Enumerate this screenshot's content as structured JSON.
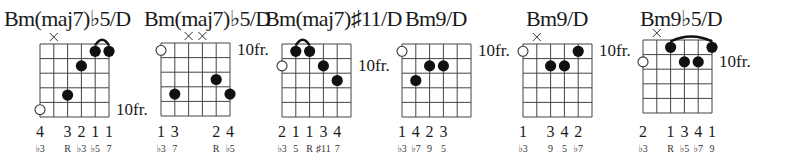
{
  "diagram": {
    "strings": 6,
    "frets_shown": 5,
    "chords": [
      {
        "name": "Bm(maj7)♭5/D",
        "grid_x": 40,
        "grid_y": 44,
        "title_x": 4,
        "fret_position": "10fr.",
        "fret_label_row": 5,
        "muted": [
          2
        ],
        "open": [
          {
            "string": 1,
            "row": 5
          }
        ],
        "dots": [
          {
            "string": 5,
            "fret": 1
          },
          {
            "string": 6,
            "fret": 1
          },
          {
            "string": 4,
            "fret": 2
          },
          {
            "string": 3,
            "fret": 4
          }
        ],
        "barre": {
          "from": 5,
          "to": 6,
          "fret": 1
        },
        "fingers": [
          "4",
          "",
          "3",
          "2",
          "1",
          "1"
        ],
        "degrees": [
          "♭3",
          "",
          "R",
          "♭3",
          "♭5",
          "7"
        ]
      },
      {
        "name": "Bm(maj7)♭5/D",
        "grid_x": 161,
        "grid_y": 43,
        "title_x": 144,
        "fret_position": "10fr.",
        "fret_label_row": 1,
        "muted": [
          3,
          4
        ],
        "open": [
          {
            "string": 1,
            "row": 1
          }
        ],
        "dots": [
          {
            "string": 5,
            "fret": 3
          },
          {
            "string": 2,
            "fret": 4
          },
          {
            "string": 6,
            "fret": 4
          }
        ],
        "barre": null,
        "fingers": [
          "1",
          "3",
          "",
          "",
          "2",
          "4"
        ],
        "degrees": [
          "♭3",
          "7",
          "",
          "",
          "R",
          "♭5"
        ]
      },
      {
        "name": "Bm(maj7)♯11/D",
        "grid_x": 282,
        "grid_y": 44,
        "title_x": 265,
        "fret_position": "10fr.",
        "fret_label_row": 2,
        "muted": [],
        "open": [
          {
            "string": 1,
            "row": 2
          }
        ],
        "dots": [
          {
            "string": 2,
            "fret": 1
          },
          {
            "string": 3,
            "fret": 1
          },
          {
            "string": 4,
            "fret": 2
          },
          {
            "string": 5,
            "fret": 3
          }
        ],
        "barre": {
          "from": 2,
          "to": 3,
          "fret": 1
        },
        "fingers": [
          "2",
          "1",
          "1",
          "3",
          "4",
          ""
        ],
        "degrees": [
          "♭3",
          "5",
          "R",
          "♯11",
          "7",
          ""
        ]
      },
      {
        "name": "Bm9/D",
        "grid_x": 402,
        "grid_y": 44,
        "title_x": 405,
        "fret_position": "10fr.",
        "fret_label_row": 1,
        "muted": [],
        "open": [
          {
            "string": 1,
            "row": 1
          }
        ],
        "dots": [
          {
            "string": 3,
            "fret": 2
          },
          {
            "string": 4,
            "fret": 2
          },
          {
            "string": 2,
            "fret": 3
          }
        ],
        "barre": null,
        "fingers": [
          "1",
          "4",
          "2",
          "3",
          "",
          ""
        ],
        "degrees": [
          "♭3",
          "♭7",
          "9",
          "5",
          "",
          ""
        ]
      },
      {
        "name": "Bm9/D",
        "grid_x": 523,
        "grid_y": 44,
        "title_x": 526,
        "fret_position": "10fr.",
        "fret_label_row": 1,
        "muted": [
          2
        ],
        "open": [
          {
            "string": 1,
            "row": 1
          }
        ],
        "dots": [
          {
            "string": 5,
            "fret": 1
          },
          {
            "string": 3,
            "fret": 2
          },
          {
            "string": 4,
            "fret": 2
          }
        ],
        "barre": null,
        "fingers": [
          "1",
          "",
          "3",
          "4",
          "2",
          ""
        ],
        "degrees": [
          "♭3",
          "",
          "9",
          "5",
          "♭7",
          ""
        ]
      },
      {
        "name": "Bm9♭5/D",
        "grid_x": 643,
        "grid_y": 40,
        "title_x": 640,
        "fret_position": "10fr.",
        "fret_label_row": 2,
        "muted": [
          2
        ],
        "open": [
          {
            "string": 1,
            "row": 2
          }
        ],
        "dots": [
          {
            "string": 3,
            "fret": 1
          },
          {
            "string": 6,
            "fret": 1
          },
          {
            "string": 4,
            "fret": 2
          },
          {
            "string": 5,
            "fret": 2
          }
        ],
        "barre": {
          "from": 3,
          "to": 6,
          "fret": 1
        },
        "fingers": [
          "2",
          "",
          "1",
          "3",
          "4",
          "1"
        ],
        "degrees": [
          "♭3",
          "",
          "R",
          "♭5",
          "♭7",
          "9"
        ]
      }
    ]
  }
}
